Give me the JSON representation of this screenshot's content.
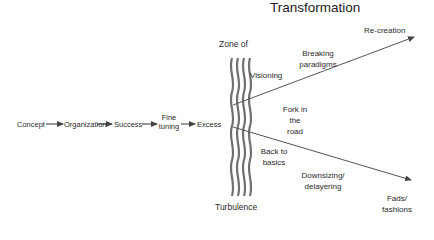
{
  "title": "Transformation",
  "flow": {
    "steps": [
      "Concept",
      "Organization",
      "Success",
      "Fine\ntuning",
      "Excess"
    ]
  },
  "zone": {
    "top_label": "Zone of",
    "bottom_label": "Turbulence"
  },
  "branches": {
    "upper": {
      "path_label": "Breaking paradigms",
      "path_label_lines": [
        "Breaking",
        "paradigms"
      ],
      "end_label": "Re-creation"
    },
    "lower": {
      "path_label_lines": [
        "Downsizing/",
        "delayering"
      ],
      "end_label_lines": [
        "Fads/",
        "fashions"
      ]
    }
  },
  "annotations": {
    "visioning": "Visioning",
    "fork_lines": [
      "Fork in",
      "the",
      "road"
    ],
    "back_lines": [
      "Back to",
      "basics"
    ]
  },
  "colors": {
    "line": "#555555",
    "wave": "#6e6e6e",
    "text": "#2a2a2a"
  }
}
